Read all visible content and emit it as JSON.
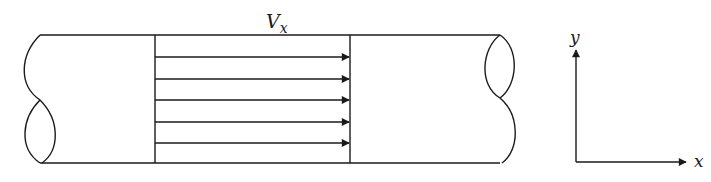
{
  "diagram": {
    "type": "pipe-flow-uniform-velocity-profile",
    "velocity_label": {
      "main": "V",
      "subscript": "x"
    },
    "axes": {
      "y_label": "y",
      "x_label": "x"
    },
    "arrows_count": 5,
    "colors": {
      "line": "#1a1a1a",
      "background": "#ffffff"
    }
  }
}
